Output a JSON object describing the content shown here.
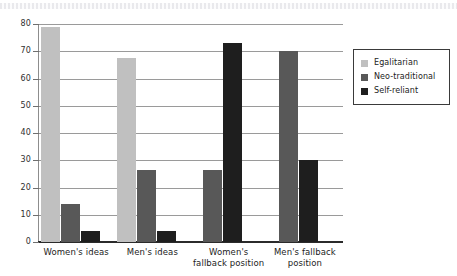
{
  "chart_data": {
    "type": "bar",
    "title": "",
    "subtitle": "",
    "xlabel": "",
    "ylabel": "",
    "ylim": [
      0,
      80
    ],
    "ytick_step": 10,
    "yticks": [
      80,
      70,
      60,
      50,
      40,
      30,
      20,
      10,
      0
    ],
    "grid": true,
    "grid_axis": "y",
    "legend_position": "right",
    "categories": [
      "Women's ideas",
      "Men's ideas",
      "Women's fallback position",
      "Men's fallback position"
    ],
    "category_lines": [
      [
        "Women's ideas"
      ],
      [
        "Men's ideas"
      ],
      [
        "Women's",
        "fallback position"
      ],
      [
        "Men's fallback",
        "position"
      ]
    ],
    "series": [
      {
        "name": "Egalitarian",
        "color": "#c0c0c0",
        "values": [
          79,
          67.5,
          null,
          null
        ]
      },
      {
        "name": "Neo-traditional",
        "color": "#585858",
        "values": [
          14,
          26.5,
          26.5,
          70
        ]
      },
      {
        "name": "Self-reliant",
        "color": "#1e1e1e",
        "values": [
          4,
          4,
          73,
          30
        ]
      }
    ]
  },
  "legend": {
    "items": [
      {
        "label": "Egalitarian",
        "swatch": "egalitarian"
      },
      {
        "label": "Neo-traditional",
        "swatch": "neo-traditional"
      },
      {
        "label": "Self-reliant",
        "swatch": "self-reliant"
      }
    ]
  },
  "axis": {
    "y_tick_labels": [
      "80",
      "70",
      "60",
      "50",
      "40",
      "30",
      "20",
      "10",
      "0"
    ]
  }
}
